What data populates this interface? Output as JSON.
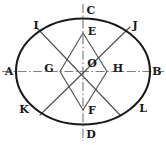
{
  "figure": {
    "type": "geometry-diagram",
    "width": 166,
    "height": 145,
    "background_color": "#ffffff",
    "stroke_color": "#1a1a1a",
    "chord_color": "#4d4d4d",
    "axis_color": "#808080",
    "ellipse": {
      "center_x": 83,
      "center_y": 71.5,
      "radius_x": 67,
      "radius_y": 53,
      "stroke_width": 2.1
    },
    "axes": [
      {
        "name": "horizontal-axis-AB",
        "style": "dash-dot",
        "x1": 2,
        "y1": 71.5,
        "x2": 164,
        "y2": 71.5
      },
      {
        "name": "vertical-axis-CD",
        "style": "dash-dot",
        "x1": 83,
        "y1": 4,
        "x2": 83,
        "y2": 141
      }
    ],
    "rhombus": {
      "name": "rhombus-EGFH",
      "points": "83,33 60,71.5 83,110 107,71.5",
      "stroke_width": 1.1
    },
    "chords": [
      {
        "name": "chord-IL",
        "x1": 36,
        "y1": 27,
        "x2": 120,
        "y2": 115
      },
      {
        "name": "chord-JK",
        "x1": 130,
        "y1": 27,
        "x2": 40,
        "y2": 115
      }
    ],
    "points": [
      {
        "id": "A",
        "label": "A",
        "label_x": 9,
        "label_y": 71,
        "mark_x": 16,
        "mark_y": 71.5
      },
      {
        "id": "B",
        "label": "B",
        "label_x": 157,
        "label_y": 71,
        "mark_x": 150,
        "mark_y": 71.5
      },
      {
        "id": "C",
        "label": "C",
        "label_x": 91,
        "label_y": 10,
        "mark_x": 83,
        "mark_y": 18.5
      },
      {
        "id": "D",
        "label": "D",
        "label_x": 91,
        "label_y": 134,
        "mark_x": 83,
        "mark_y": 124.5
      },
      {
        "id": "E",
        "label": "E",
        "label_x": 92,
        "label_y": 31,
        "mark_x": 83,
        "mark_y": 33
      },
      {
        "id": "F",
        "label": "F",
        "label_x": 92,
        "label_y": 110,
        "mark_x": 83,
        "mark_y": 110
      },
      {
        "id": "G",
        "label": "G",
        "label_x": 49,
        "label_y": 68,
        "mark_x": 60,
        "mark_y": 71.5
      },
      {
        "id": "H",
        "label": "H",
        "label_x": 118,
        "label_y": 68,
        "mark_x": 107,
        "mark_y": 71.5
      },
      {
        "id": "I",
        "label": "I",
        "label_x": 36,
        "label_y": 25,
        "mark_x": 36,
        "mark_y": 33
      },
      {
        "id": "J",
        "label": "J",
        "label_x": 135,
        "label_y": 25,
        "mark_x": 130,
        "mark_y": 33
      },
      {
        "id": "K",
        "label": "K",
        "label_x": 24,
        "label_y": 109,
        "mark_x": 31,
        "mark_y": 110
      },
      {
        "id": "L",
        "label": "L",
        "label_x": 143,
        "label_y": 108,
        "mark_x": 136,
        "mark_y": 110
      },
      {
        "id": "O",
        "label": "O",
        "label_x": 92,
        "label_y": 63,
        "mark_x": 83,
        "mark_y": 71.5
      }
    ]
  }
}
